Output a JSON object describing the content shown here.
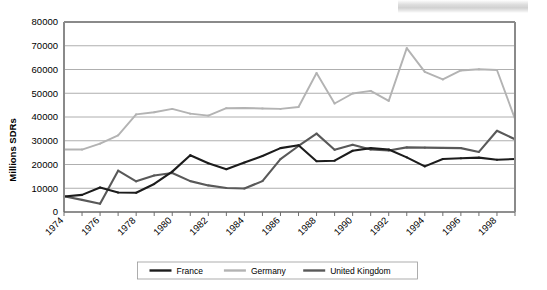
{
  "chart_data": {
    "type": "line",
    "title": "",
    "xlabel": "",
    "ylabel": "Millions SDRs",
    "ylim": [
      0,
      80000
    ],
    "ytick_values": [
      0,
      10000,
      20000,
      30000,
      40000,
      50000,
      60000,
      70000,
      80000
    ],
    "ytick_labels": [
      "0",
      "10000",
      "20000",
      "30000",
      "40000",
      "50000",
      "60000",
      "70000",
      "80000"
    ],
    "xlim": [
      1974,
      1999
    ],
    "x": [
      1974,
      1975,
      1976,
      1977,
      1978,
      1979,
      1980,
      1981,
      1982,
      1983,
      1984,
      1985,
      1986,
      1987,
      1988,
      1989,
      1990,
      1991,
      1992,
      1993,
      1994,
      1995,
      1996,
      1997,
      1998,
      1999
    ],
    "xtick_labels": [
      "1974",
      "1976",
      "1978",
      "1980",
      "1982",
      "1984",
      "1986",
      "1988",
      "1990",
      "1992",
      "1994",
      "1996",
      "1998"
    ],
    "xtick_values": [
      1974,
      1976,
      1978,
      1980,
      1982,
      1984,
      1986,
      1988,
      1990,
      1992,
      1994,
      1996,
      1998
    ],
    "grid": "horizontal",
    "legend_position": "bottom",
    "series": [
      {
        "name": "France",
        "color": "#1c1c1c",
        "values": [
          6500,
          7200,
          10300,
          8200,
          8100,
          11800,
          17000,
          23900,
          20500,
          18000,
          20800,
          23600,
          26900,
          28100,
          21400,
          21600,
          25800,
          26900,
          26300,
          23000,
          19200,
          22300,
          22600,
          22900,
          22000,
          22300
        ]
      },
      {
        "name": "Germany",
        "color": "#b3b3b3",
        "values": [
          26300,
          26300,
          28800,
          32300,
          41100,
          42000,
          43400,
          41400,
          40600,
          43700,
          43800,
          43600,
          43400,
          44200,
          58500,
          45700,
          49900,
          51000,
          46800,
          69000,
          59000,
          55800,
          59600,
          60100,
          59800,
          39200
        ]
      },
      {
        "name": "United Kingdom",
        "color": "#595959",
        "values": [
          6600,
          5100,
          3500,
          17400,
          12900,
          15400,
          16400,
          13000,
          11200,
          10100,
          9900,
          13000,
          22300,
          27800,
          33000,
          26200,
          28300,
          26300,
          25900,
          27200,
          27100,
          27000,
          26900,
          25300,
          34200,
          30600
        ]
      }
    ]
  },
  "legend": {
    "items": [
      {
        "label": "France"
      },
      {
        "label": "Germany"
      },
      {
        "label": "United Kingdom"
      }
    ]
  }
}
